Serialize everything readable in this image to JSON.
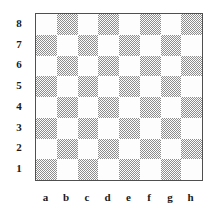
{
  "figure": {
    "kind": "chessboard"
  },
  "board": {
    "files": [
      "a",
      "b",
      "c",
      "d",
      "e",
      "f",
      "g",
      "h"
    ],
    "ranks": [
      "8",
      "7",
      "6",
      "5",
      "4",
      "3",
      "2",
      "1"
    ],
    "size": 8,
    "light_square_color": "#fdfdfd",
    "dark_square_color": "#b8b8b8",
    "border_color": "#4f4f4f",
    "label_color": "#1a1a1a",
    "background_color": "#ffffff",
    "orientation": "white-at-bottom",
    "a8_is_light": true,
    "pieces": [],
    "squares": [
      [
        "light",
        "dark",
        "light",
        "dark",
        "light",
        "dark",
        "light",
        "dark"
      ],
      [
        "dark",
        "light",
        "dark",
        "light",
        "dark",
        "light",
        "dark",
        "light"
      ],
      [
        "light",
        "dark",
        "light",
        "dark",
        "light",
        "dark",
        "light",
        "dark"
      ],
      [
        "dark",
        "light",
        "dark",
        "light",
        "dark",
        "light",
        "dark",
        "light"
      ],
      [
        "light",
        "dark",
        "light",
        "dark",
        "light",
        "dark",
        "light",
        "dark"
      ],
      [
        "dark",
        "light",
        "dark",
        "light",
        "dark",
        "light",
        "dark",
        "light"
      ],
      [
        "light",
        "dark",
        "light",
        "dark",
        "light",
        "dark",
        "light",
        "dark"
      ],
      [
        "dark",
        "light",
        "dark",
        "light",
        "dark",
        "light",
        "dark",
        "light"
      ]
    ]
  }
}
